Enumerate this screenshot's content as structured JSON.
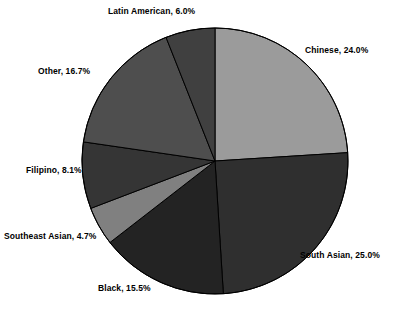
{
  "chart_data": {
    "type": "pie",
    "title": "",
    "subtitle": "",
    "xlabel": "",
    "ylabel": "",
    "legend_position": "none",
    "grid": false,
    "label_format": "{name}, {value}%",
    "start_angle_deg": 0,
    "direction": "clockwise",
    "categories": [
      "Chinese",
      "South Asian",
      "Black",
      "Southeast Asian",
      "Filipino",
      "Other",
      "Latin American"
    ],
    "values": [
      24.0,
      25.0,
      15.5,
      4.7,
      8.1,
      16.7,
      6.0
    ],
    "total": 100.0,
    "slices": [
      {
        "name": "Chinese",
        "value": 24.0,
        "label": "Chinese, 24.0%",
        "color": "#9b9b9b",
        "start_deg": 0.0,
        "end_deg": 86.4
      },
      {
        "name": "South Asian",
        "value": 25.0,
        "label": "South Asian, 25.0%",
        "color": "#2f2f2f",
        "start_deg": 86.4,
        "end_deg": 176.4
      },
      {
        "name": "Black",
        "value": 15.5,
        "label": "Black, 15.5%",
        "color": "#232323",
        "start_deg": 176.4,
        "end_deg": 232.2
      },
      {
        "name": "Southeast Asian",
        "value": 4.7,
        "label": "Southeast Asian, 4.7%",
        "color": "#808080",
        "start_deg": 232.2,
        "end_deg": 249.12
      },
      {
        "name": "Filipino",
        "value": 8.1,
        "label": "Filipino, 8.1%",
        "color": "#353535",
        "start_deg": 249.12,
        "end_deg": 278.28
      },
      {
        "name": "Other",
        "value": 16.7,
        "label": "Other, 16.7%",
        "color": "#4e4e4e",
        "start_deg": 278.28,
        "end_deg": 338.4
      },
      {
        "name": "Latin American",
        "value": 6.0,
        "label": "Latin American, 6.0%",
        "color": "#404040",
        "start_deg": 338.4,
        "end_deg": 360.0
      }
    ],
    "geometry": {
      "center_x": 215,
      "center_y": 161,
      "radius": 133,
      "outline_color": "#000000",
      "background": "#ffffff"
    }
  }
}
